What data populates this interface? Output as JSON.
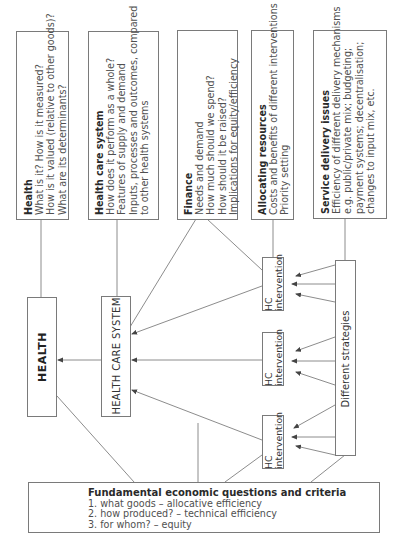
{
  "diagram": {
    "top_boxes": [
      {
        "id": "health",
        "title": "Health",
        "lines": [
          "What is it? How is it measured?",
          "How is it valued (relative to other goods)?",
          "What are its determinants?"
        ]
      },
      {
        "id": "health-care-system",
        "title": "Health care system",
        "lines": [
          "How does it perform as a whole?",
          "Features of supply and demand",
          "Inputs, processes and outcomes, compared",
          "to other health systems"
        ]
      },
      {
        "id": "finance",
        "title": "Finance",
        "lines": [
          "Needs and demand",
          "How much should we spend?",
          "How should it be raised?",
          "Implications for equity/efficiency"
        ]
      },
      {
        "id": "allocating-resources",
        "title": "Allocating resources",
        "lines": [
          "Costs and benefits of different interventions",
          "Priority setting"
        ]
      },
      {
        "id": "service-delivery",
        "title": "Service delivery issues",
        "lines": [
          "Efficiency of different delivery mechanisms",
          "e.g. public/private mix; budgeting;",
          "payment systems; decentralisation;",
          "changes to input mix, etc."
        ]
      }
    ],
    "health_label": "HEALTH",
    "health_care_system_label": "HEALTH CARE SYSTEM",
    "interventions": [
      {
        "line1": "HC",
        "line2": "intervention"
      },
      {
        "line1": "HC",
        "line2": "intervention"
      },
      {
        "line1": "HC",
        "line2": "intervention"
      }
    ],
    "strategies_label": "Different strategies",
    "fundamental": {
      "title": "Fundamental economic questions and criteria",
      "lines": [
        "1. what goods – allocative efficiency",
        "2. how produced? – technical efficiency",
        "3. for whom? – equity"
      ]
    }
  },
  "colors": {
    "line": "#6e6e6e",
    "border": "#7a7a7a",
    "text": "#3a3a3a"
  }
}
